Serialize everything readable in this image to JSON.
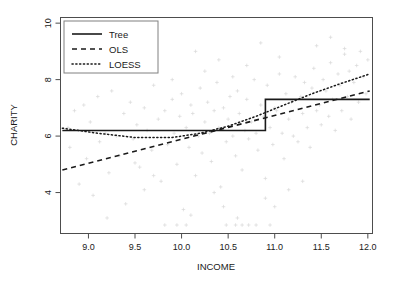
{
  "chart_data": {
    "type": "scatter",
    "title": "",
    "xlabel": "INCOME",
    "ylabel": "CHARITY",
    "xlim": [
      8.7,
      12.05
    ],
    "ylim": [
      2.55,
      10.2
    ],
    "xticks": [
      9.0,
      9.5,
      10.0,
      10.5,
      11.0,
      11.5,
      12.0
    ],
    "xticklabels": [
      "9.0",
      "9.5",
      "10.0",
      "10.5",
      "11.0",
      "11.5",
      "12.0"
    ],
    "yticks": [
      4,
      6,
      8,
      10
    ],
    "yticklabels": [
      "4",
      "6",
      "8",
      "10"
    ],
    "grid": false,
    "point_color": "#d9d9d9",
    "point_marker": "plus",
    "line_color": "#1a1a1a",
    "legend": {
      "position": "top-left",
      "entries": [
        {
          "name": "Tree",
          "style": "solid"
        },
        {
          "name": "OLS",
          "style": "dashed"
        },
        {
          "name": "LOESS",
          "style": "dotted"
        }
      ]
    },
    "series": [
      {
        "name": "Tree",
        "style": "solid",
        "type": "step",
        "breakpoint": 10.9,
        "x": [
          8.72,
          10.9,
          10.9,
          12.02
        ],
        "values": [
          6.2,
          6.2,
          7.3,
          7.3
        ]
      },
      {
        "name": "OLS",
        "style": "dashed",
        "type": "line",
        "slope": 0.85,
        "intercept": -2.61,
        "x": [
          8.72,
          12.02
        ],
        "values": [
          4.8,
          7.6
        ]
      },
      {
        "name": "LOESS",
        "style": "dotted",
        "type": "smooth",
        "x": [
          8.72,
          9.1,
          9.5,
          9.9,
          10.2,
          10.5,
          10.8,
          11.1,
          11.4,
          11.7,
          12.02
        ],
        "values": [
          6.28,
          6.1,
          5.95,
          5.95,
          6.1,
          6.35,
          6.7,
          7.1,
          7.5,
          7.85,
          8.2
        ]
      }
    ],
    "points": [
      [
        8.78,
        6.3
      ],
      [
        8.8,
        5.6
      ],
      [
        8.85,
        6.9
      ],
      [
        8.9,
        4.3
      ],
      [
        8.95,
        7.1
      ],
      [
        8.98,
        5.2
      ],
      [
        9.02,
        6.5
      ],
      [
        9.05,
        3.9
      ],
      [
        9.1,
        7.4
      ],
      [
        9.12,
        5.8
      ],
      [
        9.18,
        6.1
      ],
      [
        9.22,
        4.7
      ],
      [
        9.25,
        7.6
      ],
      [
        9.3,
        6.0
      ],
      [
        9.33,
        5.3
      ],
      [
        9.38,
        6.8
      ],
      [
        9.4,
        3.6
      ],
      [
        9.45,
        7.2
      ],
      [
        9.48,
        5.9
      ],
      [
        9.52,
        6.4
      ],
      [
        9.55,
        4.9
      ],
      [
        9.6,
        7.0
      ],
      [
        9.63,
        6.2
      ],
      [
        9.68,
        5.5
      ],
      [
        9.7,
        7.8
      ],
      [
        9.75,
        6.6
      ],
      [
        9.78,
        4.4
      ],
      [
        9.82,
        6.9
      ],
      [
        9.85,
        5.7
      ],
      [
        9.9,
        7.3
      ],
      [
        9.92,
        6.1
      ],
      [
        9.95,
        5.0
      ],
      [
        9.98,
        6.7
      ],
      [
        10.0,
        7.5
      ],
      [
        10.02,
        3.4
      ],
      [
        10.05,
        6.3
      ],
      [
        10.08,
        5.6
      ],
      [
        10.1,
        7.1
      ],
      [
        10.12,
        6.8
      ],
      [
        10.15,
        4.6
      ],
      [
        10.18,
        6.0
      ],
      [
        10.2,
        7.7
      ],
      [
        10.22,
        5.4
      ],
      [
        10.25,
        6.5
      ],
      [
        10.28,
        7.2
      ],
      [
        10.3,
        6.1
      ],
      [
        10.32,
        5.1
      ],
      [
        10.35,
        6.9
      ],
      [
        10.38,
        7.9
      ],
      [
        10.4,
        6.3
      ],
      [
        10.42,
        4.2
      ],
      [
        10.45,
        7.0
      ],
      [
        10.48,
        5.8
      ],
      [
        10.5,
        6.6
      ],
      [
        10.52,
        7.4
      ],
      [
        10.55,
        6.0
      ],
      [
        10.58,
        5.3
      ],
      [
        10.6,
        7.6
      ],
      [
        10.62,
        6.8
      ],
      [
        10.65,
        4.8
      ],
      [
        10.68,
        6.2
      ],
      [
        10.7,
        7.3
      ],
      [
        10.72,
        5.9
      ],
      [
        10.75,
        6.5
      ],
      [
        10.78,
        8.0
      ],
      [
        10.8,
        6.1
      ],
      [
        10.82,
        5.5
      ],
      [
        10.85,
        7.1
      ],
      [
        10.88,
        6.7
      ],
      [
        10.9,
        4.5
      ],
      [
        10.92,
        7.8
      ],
      [
        10.95,
        6.3
      ],
      [
        10.98,
        5.7
      ],
      [
        11.0,
        7.0
      ],
      [
        11.02,
        6.9
      ],
      [
        11.05,
        8.2
      ],
      [
        11.08,
        6.1
      ],
      [
        11.1,
        5.2
      ],
      [
        11.12,
        7.5
      ],
      [
        11.15,
        6.6
      ],
      [
        11.18,
        7.2
      ],
      [
        11.2,
        6.0
      ],
      [
        11.22,
        8.1
      ],
      [
        11.25,
        5.8
      ],
      [
        11.28,
        7.4
      ],
      [
        11.3,
        6.8
      ],
      [
        11.32,
        7.9
      ],
      [
        11.35,
        6.3
      ],
      [
        11.38,
        5.6
      ],
      [
        11.4,
        7.7
      ],
      [
        11.42,
        8.4
      ],
      [
        11.45,
        6.9
      ],
      [
        11.48,
        7.1
      ],
      [
        11.5,
        6.4
      ],
      [
        11.52,
        8.0
      ],
      [
        11.55,
        7.6
      ],
      [
        11.58,
        6.7
      ],
      [
        11.6,
        8.6
      ],
      [
        11.62,
        7.3
      ],
      [
        11.65,
        6.2
      ],
      [
        11.68,
        8.2
      ],
      [
        11.7,
        7.8
      ],
      [
        11.72,
        6.9
      ],
      [
        11.75,
        8.9
      ],
      [
        11.78,
        7.4
      ],
      [
        11.8,
        8.3
      ],
      [
        11.82,
        6.6
      ],
      [
        11.85,
        7.9
      ],
      [
        11.88,
        8.5
      ],
      [
        11.9,
        7.2
      ],
      [
        11.92,
        9.0
      ],
      [
        11.95,
        8.1
      ],
      [
        11.98,
        7.5
      ],
      [
        12.0,
        8.7
      ],
      [
        9.82,
        2.85
      ],
      [
        9.95,
        2.85
      ],
      [
        10.05,
        2.85
      ],
      [
        10.48,
        2.85
      ],
      [
        10.58,
        2.85
      ],
      [
        10.65,
        2.85
      ],
      [
        10.72,
        2.85
      ],
      [
        10.8,
        2.85
      ],
      [
        10.95,
        2.85
      ],
      [
        9.5,
        5.05
      ],
      [
        9.6,
        4.1
      ],
      [
        10.1,
        3.2
      ],
      [
        10.6,
        3.1
      ],
      [
        11.0,
        3.5
      ],
      [
        9.2,
        3.1
      ],
      [
        10.35,
        4.0
      ],
      [
        10.9,
        3.8
      ],
      [
        11.3,
        4.4
      ],
      [
        9.7,
        4.6
      ],
      [
        10.45,
        3.5
      ],
      [
        11.15,
        4.1
      ],
      [
        10.25,
        8.3
      ],
      [
        10.7,
        8.5
      ],
      [
        11.05,
        8.8
      ],
      [
        10.55,
        8.1
      ],
      [
        9.9,
        8.0
      ],
      [
        11.45,
        9.2
      ],
      [
        10.15,
        9.0
      ],
      [
        10.85,
        9.3
      ],
      [
        11.6,
        9.5
      ],
      [
        10.4,
        8.7
      ],
      [
        11.75,
        9.1
      ],
      [
        9.4,
        8.4
      ]
    ]
  }
}
